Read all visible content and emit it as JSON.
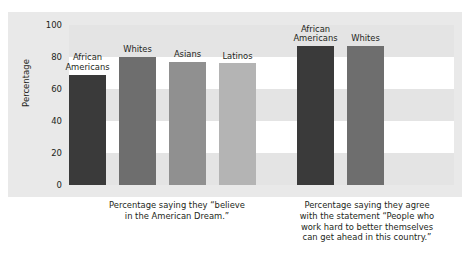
{
  "chart_data": {
    "type": "bar",
    "title": "",
    "subtitle": "",
    "xlabel": "",
    "ylabel": "Percentage",
    "ylim": [
      0,
      100
    ],
    "yticks": [
      0,
      20,
      40,
      60,
      80,
      100
    ],
    "grid": "horizontal-banded",
    "legend": "none",
    "groups": [
      {
        "caption": "Percentage saying they “believe in the American Dream.”",
        "caption_lines": [
          "Percentage saying they “believe",
          "in the American Dream.”"
        ],
        "bars": [
          {
            "label": "African Americans",
            "label_lines": [
              "African",
              "Americans"
            ],
            "value": 69,
            "color": "#3a3a3a"
          },
          {
            "label": "Whites",
            "label_lines": [
              "Whites"
            ],
            "value": 80,
            "color": "#6e6e6e"
          },
          {
            "label": "Asians",
            "label_lines": [
              "Asians"
            ],
            "value": 77,
            "color": "#909090"
          },
          {
            "label": "Latinos",
            "label_lines": [
              "Latinos"
            ],
            "value": 76,
            "color": "#b4b4b4"
          }
        ]
      },
      {
        "caption": "Percentage saying they agree with the statement “People who work hard to better themselves can get ahead in this country.”",
        "caption_lines": [
          "Percentage saying they agree",
          "with the statement “People who",
          "work hard to better themselves",
          "can get ahead in this country.”"
        ],
        "bars": [
          {
            "label": "African Americans",
            "label_lines": [
              "African",
              "Americans"
            ],
            "value": 87,
            "color": "#3a3a3a"
          },
          {
            "label": "Whites",
            "label_lines": [
              "Whites"
            ],
            "value": 87,
            "color": "#6e6e6e"
          }
        ]
      }
    ]
  },
  "colors": {
    "background": "#ffffff",
    "frame": "#e9e9e9",
    "band": "#e4e4e4",
    "text": "#231f20"
  }
}
